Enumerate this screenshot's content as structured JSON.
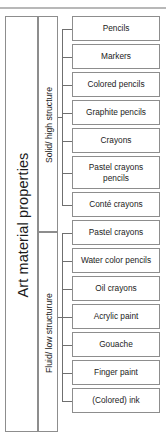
{
  "diagram": {
    "title": "Art material properties",
    "groups": [
      {
        "label": "Solid/ high structure"
      },
      {
        "label": "Fluid/ low structurure"
      }
    ],
    "items": [
      {
        "label": "Pencils",
        "group": 0
      },
      {
        "label": "Markers",
        "group": 0
      },
      {
        "label": "Colored pencils",
        "group": 0
      },
      {
        "label": "Graphite pencils",
        "group": 0
      },
      {
        "label": "Crayons",
        "group": 0
      },
      {
        "label": "Pastel crayons\npencils",
        "group": 0
      },
      {
        "label": "Conté crayons",
        "group": 0
      },
      {
        "label": "Pastel crayons",
        "group": 1
      },
      {
        "label": "Water color pencils",
        "group": 1
      },
      {
        "label": "Oil crayons",
        "group": 1
      },
      {
        "label": "Acrylic paint",
        "group": 1
      },
      {
        "label": "Gouache",
        "group": 1
      },
      {
        "label": "Finger paint",
        "group": 1
      },
      {
        "label": "(Colored) ink",
        "group": 1
      }
    ],
    "colors": {
      "border": "#8d8d8d",
      "connector": "#6f6f6f",
      "text": "#1b1b1b",
      "rule": "#b8b8b8",
      "background": "#ffffff"
    }
  }
}
